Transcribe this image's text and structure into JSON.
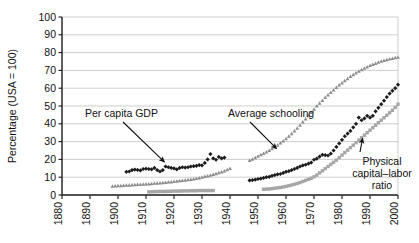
{
  "chart_data": {
    "type": "scatter",
    "title": "",
    "xlabel": "",
    "ylabel": "Percentage (USA = 100)",
    "xlim": [
      1880,
      2000
    ],
    "ylim": [
      0,
      100
    ],
    "xticks": [
      1880,
      1890,
      1900,
      1910,
      1920,
      1930,
      1940,
      1950,
      1960,
      1970,
      1980,
      1990,
      2000
    ],
    "yticks": [
      0,
      10,
      20,
      30,
      40,
      50,
      60,
      70,
      80,
      90,
      100
    ],
    "grid": "horizontal",
    "legend": "annotations",
    "annotations": [
      {
        "text": "Per capita GDP",
        "target_x": 1917,
        "target_y": 16
      },
      {
        "text": "Average schooling",
        "target_x": 1958,
        "target_y": 27
      },
      {
        "text": "Physical capital–labor ratio",
        "target_x": 1987,
        "target_y": 33
      }
    ],
    "series": [
      {
        "name": "Per capita GDP",
        "color": "#1c1c1c",
        "marker": "diamond",
        "segments": [
          {
            "x": [
              1903,
              1904,
              1905,
              1906,
              1907,
              1908,
              1909,
              1910,
              1911,
              1912,
              1913,
              1914,
              1915,
              1916,
              1917,
              1918,
              1919,
              1920,
              1921,
              1922,
              1923,
              1924,
              1925,
              1926,
              1927,
              1928,
              1929,
              1930,
              1931,
              1932,
              1933,
              1934,
              1935,
              1936,
              1937,
              1938
            ],
            "y": [
              13.0,
              13.2,
              14.0,
              14.3,
              14.1,
              13.8,
              14.6,
              14.8,
              14.6,
              14.4,
              15.2,
              14.0,
              13.2,
              14.0,
              16.0,
              15.6,
              15.2,
              15.0,
              14.4,
              15.2,
              15.6,
              15.4,
              15.6,
              16.0,
              16.2,
              16.4,
              16.8,
              16.6,
              18.0,
              20.0,
              23.0,
              20.6,
              19.8,
              21.4,
              20.6,
              21.0
            ]
          },
          {
            "x": [
              1947,
              1948,
              1949,
              1950,
              1951,
              1952,
              1953,
              1954,
              1955,
              1956,
              1957,
              1958,
              1959,
              1960,
              1961,
              1962,
              1963,
              1964,
              1965,
              1966,
              1967,
              1968,
              1969,
              1970,
              1971,
              1972,
              1973,
              1974,
              1975,
              1976,
              1977,
              1978,
              1979,
              1980,
              1981,
              1982,
              1983,
              1984,
              1985,
              1986,
              1987,
              1988,
              1989,
              1990,
              1991,
              1992,
              1993,
              1994,
              1995,
              1996,
              1997,
              1998,
              1999,
              2000
            ],
            "y": [
              8.2,
              8.4,
              8.6,
              9.0,
              9.2,
              9.6,
              10.0,
              10.2,
              10.8,
              11.2,
              11.6,
              11.8,
              12.4,
              13.0,
              13.4,
              14.0,
              14.6,
              15.2,
              16.0,
              16.6,
              17.0,
              17.6,
              18.2,
              19.8,
              20.4,
              21.6,
              22.6,
              22.4,
              22.2,
              23.2,
              25.0,
              27.0,
              29.0,
              31.0,
              33.0,
              34.5,
              36.0,
              38.0,
              40.0,
              43.5,
              42.0,
              43.0,
              44.5,
              43.5,
              44.5,
              47.0,
              49.0,
              51.0,
              53.0,
              55.0,
              57.0,
              58.5,
              60.0,
              62.0
            ]
          }
        ]
      },
      {
        "name": "Average schooling",
        "color": "#8c8c8c",
        "marker": "triangle",
        "segments": [
          {
            "x": [
              1898,
              1899,
              1900,
              1901,
              1902,
              1903,
              1904,
              1905,
              1906,
              1907,
              1908,
              1909,
              1910,
              1911,
              1912,
              1913,
              1914,
              1915,
              1916,
              1917,
              1918,
              1919,
              1920,
              1921,
              1922,
              1923,
              1924,
              1925,
              1926,
              1927,
              1928,
              1929,
              1930,
              1931,
              1932,
              1933,
              1934,
              1935,
              1936,
              1937,
              1938,
              1939,
              1940
            ],
            "y": [
              5.0,
              5.1,
              5.2,
              5.3,
              5.4,
              5.5,
              5.6,
              5.7,
              5.8,
              5.9,
              6.0,
              6.1,
              6.2,
              6.3,
              6.4,
              6.6,
              6.7,
              6.8,
              7.0,
              7.1,
              7.3,
              7.4,
              7.6,
              7.8,
              8.0,
              8.2,
              8.4,
              8.6,
              8.8,
              9.0,
              9.3,
              9.6,
              10.0,
              10.4,
              10.8,
              11.2,
              11.6,
              12.0,
              12.5,
              13.0,
              13.5,
              14.2,
              15.0
            ]
          },
          {
            "x": [
              1947,
              1948,
              1949,
              1950,
              1951,
              1952,
              1953,
              1954,
              1955,
              1956,
              1957,
              1958,
              1959,
              1960,
              1961,
              1962,
              1963,
              1964,
              1965,
              1966,
              1967,
              1968,
              1969,
              1970,
              1971,
              1972,
              1973,
              1974,
              1975,
              1976,
              1977,
              1978,
              1979,
              1980,
              1981,
              1982,
              1983,
              1984,
              1985,
              1986,
              1987,
              1988,
              1989,
              1990,
              1991,
              1992,
              1993,
              1994,
              1995,
              1996,
              1997,
              1998,
              1999,
              2000
            ],
            "y": [
              19.5,
              20.2,
              21.0,
              21.8,
              22.6,
              23.4,
              24.2,
              25.0,
              26.0,
              27.0,
              28.0,
              29.2,
              30.4,
              31.6,
              33.0,
              34.4,
              36.0,
              37.6,
              39.2,
              41.0,
              42.8,
              44.6,
              46.4,
              48.2,
              50.0,
              51.6,
              53.2,
              54.8,
              56.2,
              57.6,
              59.0,
              60.4,
              61.8,
              63.0,
              64.2,
              65.4,
              66.6,
              67.6,
              68.6,
              69.6,
              70.4,
              71.2,
              72.0,
              72.8,
              73.4,
              74.0,
              74.6,
              75.2,
              75.6,
              76.0,
              76.4,
              76.8,
              77.1,
              77.4
            ]
          }
        ]
      },
      {
        "name": "Physical capital–labor ratio",
        "color": "#a6a6a6",
        "marker": "square",
        "segments": [
          {
            "x": [
              1911,
              1912,
              1913,
              1914,
              1915,
              1916,
              1917,
              1918,
              1919,
              1920,
              1921,
              1922,
              1923,
              1924,
              1925,
              1926,
              1927,
              1928,
              1929,
              1930,
              1931,
              1932,
              1933,
              1934
            ],
            "y": [
              1.8,
              1.8,
              1.9,
              1.9,
              2.0,
              2.0,
              2.0,
              2.1,
              2.1,
              2.2,
              2.2,
              2.2,
              2.3,
              2.3,
              2.3,
              2.4,
              2.4,
              2.4,
              2.5,
              2.5,
              2.5,
              2.5,
              2.5,
              2.5
            ]
          },
          {
            "x": [
              1952,
              1953,
              1954,
              1955,
              1956,
              1957,
              1958,
              1959,
              1960,
              1961,
              1962,
              1963,
              1964,
              1965,
              1966,
              1967,
              1968,
              1969,
              1970,
              1971,
              1972,
              1973,
              1974,
              1975,
              1976,
              1977,
              1978,
              1979,
              1980,
              1981,
              1982,
              1983,
              1984,
              1985,
              1986,
              1987,
              1988,
              1989,
              1990,
              1991,
              1992,
              1993,
              1994,
              1995,
              1996,
              1997,
              1998,
              1999,
              2000
            ],
            "y": [
              3.2,
              3.3,
              3.4,
              3.6,
              3.8,
              4.0,
              4.2,
              4.5,
              4.8,
              5.2,
              5.6,
              6.0,
              6.5,
              7.0,
              7.6,
              8.2,
              8.8,
              9.4,
              10.2,
              11.2,
              12.4,
              13.6,
              14.8,
              16.0,
              17.2,
              18.4,
              19.6,
              21.0,
              22.4,
              23.8,
              25.2,
              26.6,
              28.0,
              29.4,
              30.8,
              32.2,
              33.6,
              35.0,
              36.4,
              37.8,
              39.2,
              40.6,
              42.0,
              43.4,
              44.8,
              46.2,
              47.6,
              49.2,
              51.0
            ]
          }
        ]
      }
    ]
  },
  "annotations": {
    "gdp_label": "Per capita GDP",
    "schooling_label": "Average schooling",
    "capital_label_line1": "Physical",
    "capital_label_line2": "capital–labor",
    "capital_label_line3": "ratio"
  }
}
